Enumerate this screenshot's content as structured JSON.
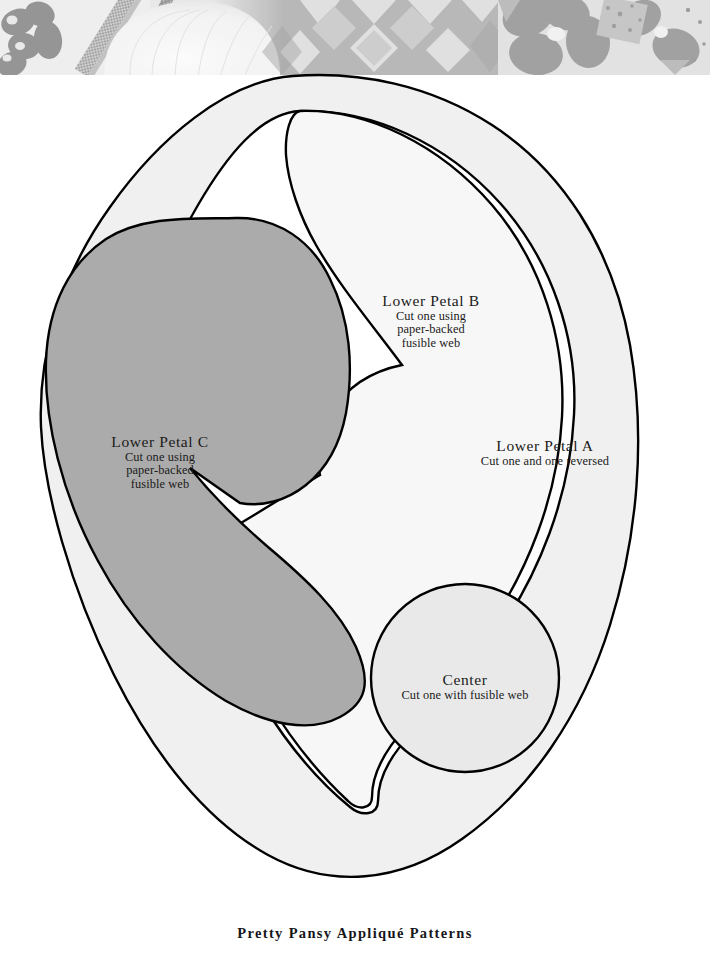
{
  "page": {
    "caption": "Pretty Pansy Appliqué Patterns",
    "background_color": "#ffffff"
  },
  "photo": {
    "name": "quilt-photograph-strip",
    "description": "grayscale photograph of a finished appliqué quilt border",
    "palette": {
      "background_light": "#ebebeb",
      "mid_gray": "#b4b4b4",
      "dark_gray": "#8f8f8f",
      "darkest_gray": "#7d7d7d",
      "highlight": "#f4f4f4"
    }
  },
  "pattern": {
    "colors": {
      "outline": "#000000",
      "petal_a_fill": "#f0f0f0",
      "petal_b_fill": "#f7f7f7",
      "petal_c_fill": "#ababab",
      "center_fill": "#e9e9e9",
      "paper_white": "#ffffff"
    },
    "pieces": [
      {
        "id": "lower-petal-b",
        "title": "Lower Petal B",
        "lines": [
          "Cut one using",
          "paper-backed",
          "fusible web"
        ]
      },
      {
        "id": "lower-petal-c",
        "title": "Lower Petal C",
        "lines": [
          "Cut one using",
          "paper-backed",
          "fusible web"
        ]
      },
      {
        "id": "lower-petal-a",
        "title": "Lower Petal A",
        "lines": [
          "Cut one and one reversed"
        ]
      },
      {
        "id": "center",
        "title": "Center",
        "lines": [
          "Cut one with fusible web"
        ]
      }
    ]
  }
}
